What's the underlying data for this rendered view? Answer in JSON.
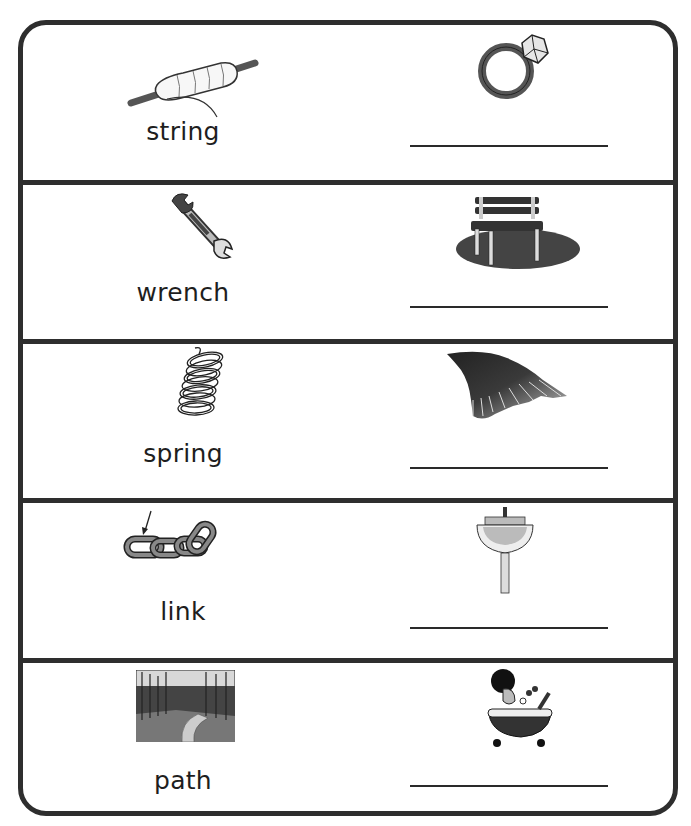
{
  "worksheet": {
    "rows": [
      {
        "word": "string",
        "left_picture": "spool-of-string",
        "right_picture": "ring",
        "answer": ""
      },
      {
        "word": "wrench",
        "left_picture": "wrench",
        "right_picture": "park-bench",
        "answer": ""
      },
      {
        "word": "spring",
        "left_picture": "coil-spring",
        "right_picture": "bird-wing",
        "answer": ""
      },
      {
        "word": "link",
        "left_picture": "chain-link-with-arrow",
        "right_picture": "sink",
        "answer": ""
      },
      {
        "word": "path",
        "left_picture": "forest-path",
        "right_picture": "bath",
        "answer": ""
      }
    ]
  },
  "colors": {
    "border": "#2e2e2e",
    "text": "#1e1e1e",
    "line": "#2a2a2a"
  }
}
